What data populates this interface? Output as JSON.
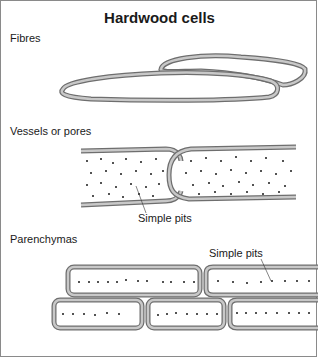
{
  "title": "Hardwood cells",
  "sections": {
    "fibres": {
      "label": "Fibres"
    },
    "vessels": {
      "label": "Vessels or pores",
      "annotation": "Simple pits"
    },
    "parenchymas": {
      "label": "Parenchymas",
      "annotation": "Simple pits"
    }
  },
  "colors": {
    "wall_outer": "#6e6e6e",
    "wall_fill": "#c4c4c4",
    "pit": "#1a1a1a",
    "border": "#8a8a8a"
  }
}
